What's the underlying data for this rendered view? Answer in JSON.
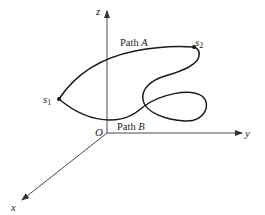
{
  "diagram": {
    "type": "3d-coordinate-paths",
    "axes": {
      "x": {
        "label": "x"
      },
      "y": {
        "label": "y"
      },
      "z": {
        "label": "z"
      },
      "origin": {
        "label": "O"
      }
    },
    "points": {
      "s1": {
        "label": "s",
        "subscript": "1"
      },
      "s2": {
        "label": "s",
        "subscript": "2"
      }
    },
    "paths": {
      "a": {
        "prefix": "Path ",
        "letter": "A"
      },
      "b": {
        "prefix": "Path ",
        "letter": "B"
      }
    },
    "colors": {
      "curve": "#1a1a1a",
      "axis": "#333333",
      "background": "#ffffff"
    }
  }
}
